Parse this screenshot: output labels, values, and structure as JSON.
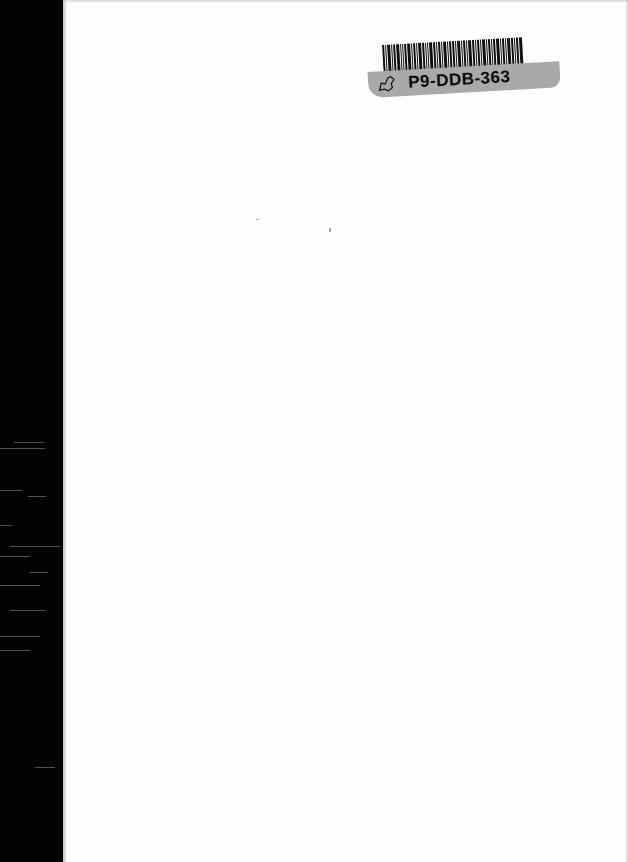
{
  "document": {
    "type": "scanned-blank-page",
    "page_color": "#fdfdfd",
    "binding_color": "#030303"
  },
  "sticker": {
    "code": "P9-DDB-363",
    "barcode": "barcode",
    "icon": "map-outline-icon",
    "strip_color": "#a9a9a9"
  }
}
